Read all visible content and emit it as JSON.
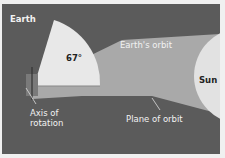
{
  "diagram": {
    "labels": {
      "earth": "Earth",
      "angle": "67°",
      "earths_orbit": "Earth's orbit",
      "sun": "Sun",
      "axis": [
        "Axis of",
        "rotation"
      ],
      "plane": "Plane of orbit"
    },
    "colors": {
      "background": "#5b5b5b",
      "orbit_plane": "#a9a9a9",
      "wedge": "#e8e8e8",
      "sun": "#e2e2e2",
      "earth": "#7a7a7a",
      "text_light": "#f2f2f2",
      "text_dark": "#222222"
    }
  }
}
